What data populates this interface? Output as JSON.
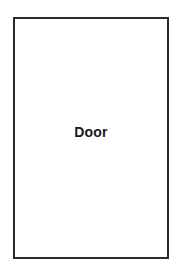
{
  "diagram": {
    "background_color": "#ffffff",
    "shapes": [
      {
        "name": "door-rectangle",
        "type": "rectangle",
        "label": "Door",
        "fill_color": "#ffffff",
        "stroke_color": "#2b2b2b",
        "stroke_width": 2,
        "label_color": "#1a1a1a"
      }
    ]
  }
}
